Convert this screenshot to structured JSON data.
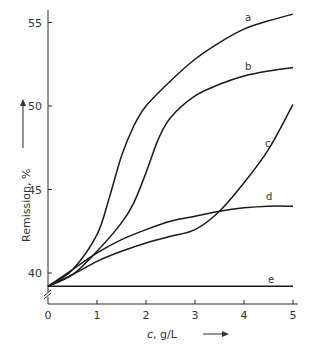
{
  "chart_data": {
    "type": "line",
    "title": "",
    "xlabel": "c, g/L",
    "ylabel": "Remission, %",
    "xlim": [
      0,
      5
    ],
    "ylim": [
      39,
      56
    ],
    "y_axis_break": true,
    "grid": false,
    "legend": "inline labels at curve ends",
    "x_ticks": [
      0,
      1,
      2,
      3,
      4,
      5
    ],
    "y_ticks": [
      40,
      45,
      50,
      55
    ],
    "series": [
      {
        "name": "a",
        "x": [
          0,
          0.5,
          1,
          1.25,
          1.5,
          1.75,
          2,
          2.5,
          3,
          3.5,
          4,
          4.5,
          5
        ],
        "values": [
          39.2,
          40.2,
          42.3,
          44.5,
          47.0,
          48.8,
          50.0,
          51.5,
          52.8,
          53.8,
          54.6,
          55.1,
          55.5
        ]
      },
      {
        "name": "b",
        "x": [
          0,
          0.5,
          1,
          1.5,
          1.75,
          2,
          2.25,
          2.5,
          3,
          3.5,
          4,
          4.5,
          5
        ],
        "values": [
          39.2,
          39.9,
          41.3,
          43.0,
          44.2,
          46.0,
          48.0,
          49.3,
          50.6,
          51.3,
          51.8,
          52.1,
          52.3
        ]
      },
      {
        "name": "c",
        "x": [
          0,
          0.5,
          1,
          1.5,
          2,
          2.5,
          3,
          3.5,
          4,
          4.5,
          5
        ],
        "values": [
          39.2,
          39.9,
          40.7,
          41.3,
          41.8,
          42.2,
          42.6,
          43.7,
          45.4,
          47.4,
          50.1
        ]
      },
      {
        "name": "d",
        "x": [
          0,
          0.5,
          1,
          1.5,
          2,
          2.5,
          3,
          3.5,
          4,
          4.5,
          5
        ],
        "values": [
          39.2,
          40.2,
          41.2,
          42.0,
          42.6,
          43.1,
          43.4,
          43.7,
          43.9,
          44.0,
          44.0
        ]
      },
      {
        "name": "e",
        "x": [
          0,
          1,
          2,
          3,
          4,
          5
        ],
        "values": [
          39.2,
          39.2,
          39.2,
          39.2,
          39.2,
          39.2
        ]
      }
    ]
  }
}
